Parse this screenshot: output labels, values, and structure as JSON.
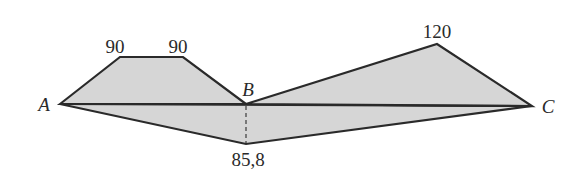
{
  "diagram": {
    "points": {
      "A": {
        "label": "A",
        "x": 60,
        "y": 104
      },
      "B": {
        "label": "B",
        "x": 246,
        "y": 104
      },
      "C": {
        "label": "C",
        "x": 532,
        "y": 106
      }
    },
    "heights": {
      "left_top_1": {
        "value": "90",
        "x": 120,
        "y": 57
      },
      "left_top_2": {
        "value": "90",
        "x": 183,
        "y": 57
      },
      "right_top": {
        "value": "120",
        "x": 437,
        "y": 44
      },
      "bottom": {
        "value": "85,8",
        "x": 246,
        "y": 144
      }
    },
    "fill_color": "#d6d6d6",
    "stroke_color": "#2a2a2a"
  }
}
